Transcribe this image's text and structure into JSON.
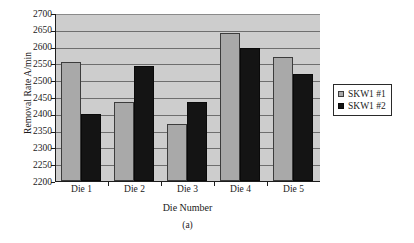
{
  "chart_data": {
    "type": "bar",
    "title": "",
    "caption": "(a)",
    "xlabel": "Die Number",
    "ylabel": "Removal Rate A/min",
    "categories": [
      "Die 1",
      "Die 2",
      "Die 3",
      "Die 4",
      "Die 5"
    ],
    "series": [
      {
        "name": "SKW1 #1",
        "color": "#a9a9a9",
        "values": [
          2555,
          2435,
          2370,
          2642,
          2570
        ]
      },
      {
        "name": "SKW1 #2",
        "color": "#141414",
        "values": [
          2400,
          2542,
          2435,
          2595,
          2518
        ]
      }
    ],
    "ylim": [
      2200,
      2700
    ],
    "yticks": [
      2200,
      2250,
      2300,
      2350,
      2400,
      2450,
      2500,
      2550,
      2600,
      2650,
      2700
    ],
    "ytick_labels": [
      "2200",
      "2250",
      "2300",
      "2350",
      "2400",
      "2450",
      "2500",
      "2550",
      "2600",
      "2650",
      "2700"
    ],
    "grid": true,
    "grid_axis": "y",
    "legend_position": "right",
    "plot_background": "#cdcdcd"
  }
}
